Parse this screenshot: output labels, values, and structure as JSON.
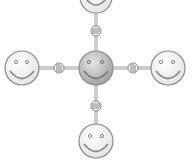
{
  "illustration": {
    "subject": "network of smiley faces connected by handshakes",
    "center_face": {
      "label": "central smiley",
      "fill": "#bdbdbd"
    },
    "outer_faces": [
      {
        "position": "top"
      },
      {
        "position": "left"
      },
      {
        "position": "right"
      },
      {
        "position": "bottom"
      }
    ],
    "colors": {
      "outline": "#8a8a8a",
      "outer_fill": "#f4f4f4",
      "connector": "#9a9a9a"
    }
  }
}
